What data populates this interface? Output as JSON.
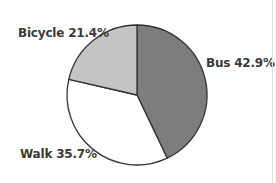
{
  "chart_data": {
    "type": "pie",
    "title": "",
    "start_angle_deg": 0,
    "direction": "clockwise",
    "slices": [
      {
        "label": "Bus",
        "value": 42.9,
        "display": "Bus 42.9%",
        "color": "#7d7d7d"
      },
      {
        "label": "Walk",
        "value": 35.7,
        "display": "Walk 35.7%",
        "color": "#ffffff"
      },
      {
        "label": "Bicycle",
        "value": 21.4,
        "display": "Bicycle 21.4%",
        "color": "#c4c4c4"
      }
    ],
    "categories": [
      "Bus",
      "Walk",
      "Bicycle"
    ],
    "values": [
      42.9,
      35.7,
      21.4
    ],
    "legend": "none (inline labels)"
  }
}
